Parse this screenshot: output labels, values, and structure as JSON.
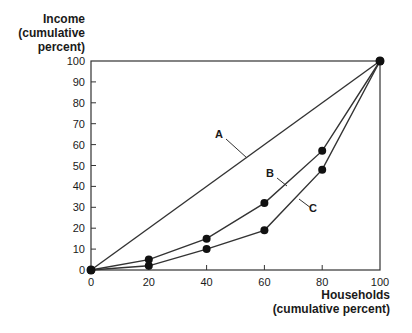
{
  "chart_data": {
    "type": "line",
    "title": "",
    "xlabel": "Households (cumulative percent)",
    "ylabel": "Income (cumulative percent)",
    "xlabel_lines": [
      "Households",
      "(cumulative percent)"
    ],
    "ylabel_lines": [
      "Income",
      "(cumulative",
      "percent)"
    ],
    "x": [
      0,
      20,
      40,
      60,
      80,
      100
    ],
    "xticks": [
      0,
      20,
      40,
      60,
      80,
      100
    ],
    "yticks": [
      0,
      10,
      20,
      30,
      40,
      50,
      60,
      70,
      80,
      90,
      100
    ],
    "xlim": [
      0,
      100
    ],
    "ylim": [
      0,
      100
    ],
    "grid": false,
    "legend": "none (inline labels A, B, C with leader lines)",
    "series": [
      {
        "name": "A",
        "x": [
          0,
          100
        ],
        "values": [
          0,
          100
        ],
        "markers": false,
        "label_pos": [
          44,
          65
        ]
      },
      {
        "name": "B",
        "x": [
          0,
          20,
          40,
          60,
          80,
          100
        ],
        "values": [
          0,
          5,
          15,
          32,
          57,
          100
        ],
        "markers": true,
        "label_pos": [
          62,
          46
        ]
      },
      {
        "name": "C",
        "x": [
          0,
          20,
          40,
          60,
          80,
          100
        ],
        "values": [
          0,
          2,
          10,
          19,
          48,
          100
        ],
        "markers": true,
        "label_pos": [
          78,
          29
        ]
      }
    ],
    "colors": {
      "line": "#333333",
      "marker": "#111111",
      "axis": "#333333"
    }
  }
}
